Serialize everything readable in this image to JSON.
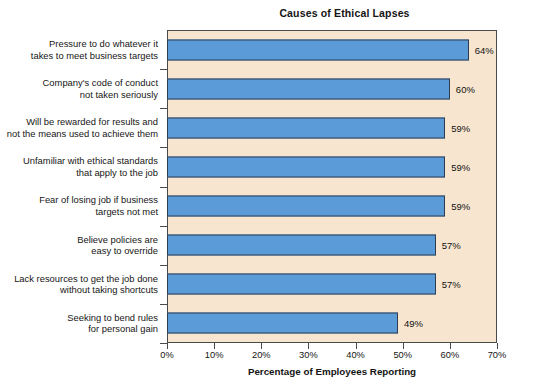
{
  "chart_data": {
    "type": "bar",
    "orientation": "horizontal",
    "title": "Causes of Ethical Lapses",
    "xlabel": "Percentage of Employees Reporting",
    "ylabel": "",
    "xlim": [
      0,
      70
    ],
    "xtick_labels": [
      "0%",
      "10%",
      "20%",
      "30%",
      "40%",
      "50%",
      "60%",
      "70%"
    ],
    "xtick_values": [
      0,
      10,
      20,
      30,
      40,
      50,
      60,
      70
    ],
    "grid": false,
    "legend": "none",
    "categories": [
      "Pressure to do whatever it takes to meet business targets",
      "Company's code of conduct not taken seriously",
      "Will be rewarded for results and not the means used to achieve them",
      "Unfamiliar with ethical standards that apply to the job",
      "Fear of losing job if business targets not met",
      "Believe policies are easy to override",
      "Lack resources to get the job done without taking shortcuts",
      "Seeking to bend rules for personal gain"
    ],
    "category_lines": [
      [
        "Pressure to do whatever it",
        "takes to meet business targets"
      ],
      [
        "Company's code of conduct",
        "not taken seriously"
      ],
      [
        "Will be rewarded for results and",
        "not the means used to achieve them"
      ],
      [
        "Unfamiliar with ethical standards",
        "that apply to the job"
      ],
      [
        "Fear of losing job if business",
        "targets not met"
      ],
      [
        "Believe policies are",
        "easy to override"
      ],
      [
        "Lack resources to get the job done",
        "without taking shortcuts"
      ],
      [
        "Seeking to bend rules",
        "for personal gain"
      ]
    ],
    "values": [
      64,
      60,
      59,
      59,
      59,
      57,
      57,
      49
    ],
    "value_labels": [
      "64%",
      "60%",
      "59%",
      "59%",
      "59%",
      "57%",
      "57%",
      "49%"
    ],
    "colors": {
      "bar_fill": "#5b9bd8",
      "bar_stroke": "#2f3d52",
      "plot_background": "#f7e5cf",
      "frame": "#4a4a4a",
      "page_background": "#ffffff",
      "text": "#141414"
    }
  }
}
